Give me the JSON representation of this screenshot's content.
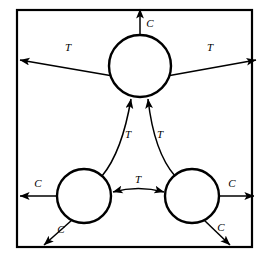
{
  "diagram": {
    "type": "node-link-diagram",
    "colors": {
      "stroke": "#000000",
      "background": "#ffffff",
      "node_fill": "#ffffff"
    },
    "frame": {
      "name": "system-boundary",
      "x": 17,
      "y": 10,
      "width": 235,
      "height": 237
    },
    "nodes": [
      {
        "id": "top",
        "label": "",
        "cx": 140,
        "cy": 66,
        "r": 31
      },
      {
        "id": "bottom-left",
        "label": "",
        "cx": 84,
        "cy": 196,
        "r": 27
      },
      {
        "id": "bottom-right",
        "label": "",
        "cx": 192,
        "cy": 196,
        "r": 27
      }
    ],
    "edges": [
      {
        "id": "top-out-up",
        "label": "C",
        "from": "top",
        "to": "boundary-top",
        "direction": "up",
        "arrowheads": "single",
        "label_x": 150,
        "label_y": 24
      },
      {
        "id": "top-out-left",
        "label": "T",
        "from": "top",
        "to": "boundary-left",
        "direction": "left",
        "arrowheads": "single",
        "label_x": 68,
        "label_y": 48
      },
      {
        "id": "top-out-right",
        "label": "T",
        "from": "top",
        "to": "boundary-right",
        "direction": "right",
        "arrowheads": "single",
        "label_x": 210,
        "label_y": 48
      },
      {
        "id": "bottom-left-to-top",
        "label": "T",
        "from": "bottom-left",
        "to": "top",
        "direction": "up-right",
        "arrowheads": "single",
        "label_x": 128,
        "label_y": 135
      },
      {
        "id": "bottom-right-to-top",
        "label": "T",
        "from": "bottom-right",
        "to": "top",
        "direction": "up-left",
        "arrowheads": "single",
        "label_x": 160,
        "label_y": 135
      },
      {
        "id": "bottom-left-right-pair",
        "label": "T",
        "from": "bottom-left",
        "to": "bottom-right",
        "direction": "bidirectional",
        "arrowheads": "double",
        "label_x": 138,
        "label_y": 180
      },
      {
        "id": "bottom-left-out-left",
        "label": "C",
        "from": "bottom-left",
        "to": "boundary-left",
        "direction": "left",
        "arrowheads": "single",
        "label_x": 38,
        "label_y": 184
      },
      {
        "id": "bottom-left-out-down",
        "label": "C",
        "from": "bottom-left",
        "to": "boundary-bottom",
        "direction": "down-left",
        "arrowheads": "single",
        "label_x": 61,
        "label_y": 230
      },
      {
        "id": "bottom-right-out-right",
        "label": "C",
        "from": "bottom-right",
        "to": "boundary-right",
        "direction": "right",
        "arrowheads": "single",
        "label_x": 232,
        "label_y": 184
      },
      {
        "id": "bottom-right-out-down",
        "label": "C",
        "from": "bottom-right",
        "to": "boundary-bottom",
        "direction": "down-right",
        "arrowheads": "single",
        "label_x": 221,
        "label_y": 228
      }
    ]
  }
}
